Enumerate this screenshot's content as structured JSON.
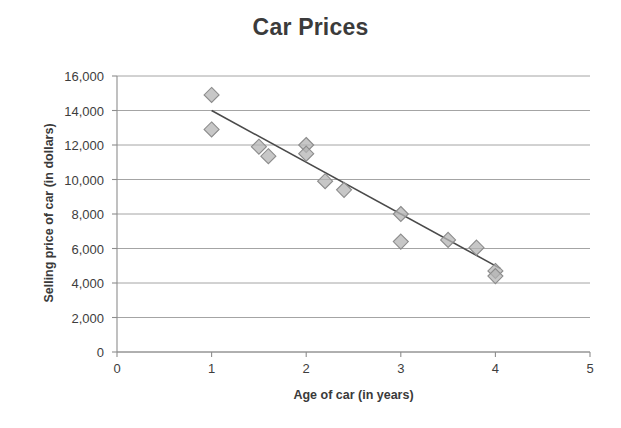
{
  "chart_data": {
    "type": "scatter",
    "title": "Car Prices",
    "xlabel": "Age of car (in years)",
    "ylabel": "Selling price of car (in dollars)",
    "xlim": [
      0,
      5
    ],
    "ylim": [
      0,
      16000
    ],
    "x_ticks": [
      0,
      1,
      2,
      3,
      4,
      5
    ],
    "x_tick_labels": [
      "0",
      "1",
      "2",
      "3",
      "4",
      "5"
    ],
    "y_ticks": [
      0,
      2000,
      4000,
      6000,
      8000,
      10000,
      12000,
      14000,
      16000
    ],
    "y_tick_labels": [
      "0",
      "2,000",
      "4,000",
      "6,000",
      "8,000",
      "10,000",
      "12,000",
      "14,000",
      "16,000"
    ],
    "grid": "horizontal",
    "legend": "none",
    "marker": "diamond",
    "marker_fill": "#b4b4b4",
    "marker_edge": "#8c8c8c",
    "points": [
      {
        "x": 1.0,
        "y": 14900
      },
      {
        "x": 1.0,
        "y": 12900
      },
      {
        "x": 1.5,
        "y": 11900
      },
      {
        "x": 1.6,
        "y": 11350
      },
      {
        "x": 2.0,
        "y": 12000
      },
      {
        "x": 2.0,
        "y": 11500
      },
      {
        "x": 2.2,
        "y": 9900
      },
      {
        "x": 2.4,
        "y": 9400
      },
      {
        "x": 3.0,
        "y": 8000
      },
      {
        "x": 3.0,
        "y": 6400
      },
      {
        "x": 3.5,
        "y": 6500
      },
      {
        "x": 3.8,
        "y": 6050
      },
      {
        "x": 4.0,
        "y": 4700
      },
      {
        "x": 4.0,
        "y": 4400
      }
    ],
    "trend_line": {
      "x_start": 1.0,
      "y_start": 14000,
      "x_end": 4.05,
      "y_end": 4850,
      "color": "#4a4a4a"
    }
  }
}
